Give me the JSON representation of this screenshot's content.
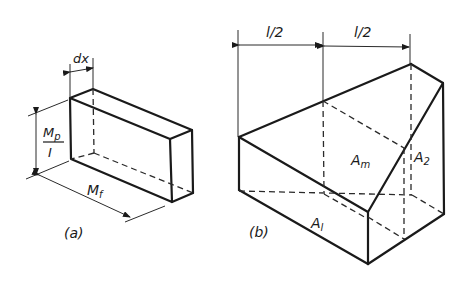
{
  "figure_a": {
    "caption": "(a)",
    "labels": {
      "width": "dx",
      "height_num": "Mp",
      "height_num_main": "M",
      "height_num_sub": "p",
      "height_den": "I",
      "length_main": "M",
      "length_sub": "f"
    }
  },
  "figure_b": {
    "caption": "(b)",
    "labels": {
      "half_length_left": "l/2",
      "half_length_right": "l/2",
      "area_mid_main": "A",
      "area_mid_sub": "m",
      "area_2_main": "A",
      "area_2_sub": "2",
      "area_1_main": "A",
      "area_1_sub": "l"
    }
  },
  "colors": {
    "ink": "#1a1a1a",
    "background": "#ffffff"
  }
}
